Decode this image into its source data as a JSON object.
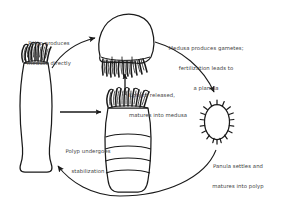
{
  "diagram": {
    "background_color": "#ffffff",
    "stroke_color": "#1a1a1a",
    "text_color": "#3c3c3c",
    "captions": [
      {
        "id": "polyp-produces-medusa",
        "line1": "Polyp produces",
        "line2": "medusa directly",
        "line3": ""
      },
      {
        "id": "medusa-produces-gametes",
        "line1": "Medusa produces gametes;",
        "line2": "fertilization leads to",
        "line3": "a planula"
      },
      {
        "id": "ephyra-released",
        "line1": "Ephyra released,",
        "line2": "matures into medusa",
        "line3": ""
      },
      {
        "id": "planula-settles",
        "line1": "Panula settles and",
        "line2": "matures into polyp",
        "line3": ""
      },
      {
        "id": "polyp-undergoes-stabilization",
        "line1": "Polyp undergoes",
        "line2": "stabilization",
        "line3": ""
      }
    ],
    "organisms": [
      {
        "id": "polyp",
        "name": "polyp"
      },
      {
        "id": "medusa",
        "name": "medusa"
      },
      {
        "id": "strobila",
        "name": "strobila"
      },
      {
        "id": "planula",
        "name": "planula"
      }
    ],
    "arrows": [
      {
        "id": "polyp-to-medusa",
        "style": "curved",
        "direction": "up-right"
      },
      {
        "id": "medusa-to-planula",
        "style": "curved",
        "direction": "down-right"
      },
      {
        "id": "planula-to-polyp",
        "style": "curved",
        "direction": "left-up"
      },
      {
        "id": "polyp-to-strobila",
        "style": "straight",
        "direction": "right"
      },
      {
        "id": "strobila-to-medusa",
        "style": "straight",
        "direction": "up"
      }
    ]
  }
}
